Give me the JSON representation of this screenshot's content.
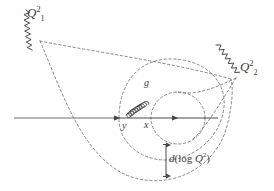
{
  "figure": {
    "kind": "feynman-evolution-diagram",
    "width": 274,
    "height": 191,
    "background_color": "#ffffff",
    "line_color": "#555555",
    "dash_color": "#666666",
    "text_color": "#3a3a3a"
  },
  "labels": {
    "q1_base": "Q",
    "q1_sup": "2",
    "q1_sub": "1",
    "q1_full": "Q²₁",
    "q2_base": "Q",
    "q2_sup": "2",
    "q2_sub": "2",
    "q2_full": "Q²₂",
    "gluon": "g",
    "y": "y",
    "x": "x",
    "d_prefix": "d",
    "d_open": "(",
    "d_log": "log",
    "d_q": "Q",
    "d_q_sup": "2",
    "d_close": ")",
    "d_full": "d (log Q²)"
  },
  "elements": {
    "axis_name": "proton-axis-line",
    "wavy_left_name": "photon-line-q1",
    "wavy_right_name": "photon-line-q2",
    "gluon_name": "gluon-coil-line",
    "big_ellipse_name": "large-dashed-ellipse",
    "small_ellipse_name": "small-dashed-ellipse",
    "outer_dashed_name": "outer-dashed-ellipse",
    "measure_arrow_name": "d-log-q2-measure-arrow",
    "arrowhead_y_name": "axis-arrowhead-y",
    "arrowhead_x_name": "axis-arrowhead-x",
    "arrowhead_right_name": "axis-arrowhead-right"
  }
}
